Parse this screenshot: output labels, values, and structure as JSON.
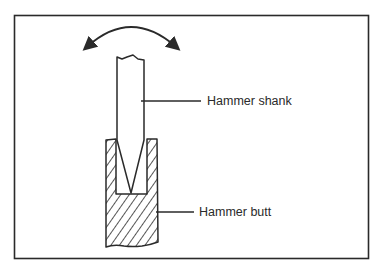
{
  "diagram": {
    "labels": {
      "shank": "Hammer shank",
      "butt": "Hammer butt"
    },
    "colors": {
      "ink": "#2a2a2a",
      "paper": "#ffffff"
    },
    "icons": {
      "motion_arrow": "double-headed-curved-arrow"
    }
  }
}
